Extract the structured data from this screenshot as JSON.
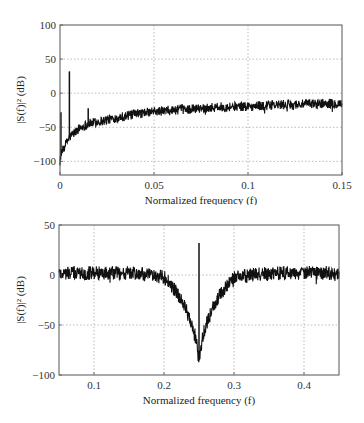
{
  "chart_data": [
    {
      "type": "line",
      "title": "",
      "xlabel": "Normalized frequency (f)",
      "ylabel": "|S(f)|² (dB)",
      "xlim": [
        0,
        0.15
      ],
      "ylim": [
        -120,
        100
      ],
      "xticks": [
        0,
        0.05,
        0.1,
        0.15
      ],
      "xtick_labels": [
        "0",
        "0.05",
        "0.1",
        "0.15"
      ],
      "yticks": [
        -100,
        -50,
        0,
        50,
        100
      ],
      "ytick_labels": [
        "−100",
        "−50",
        "0",
        "50",
        "100"
      ],
      "grid": true,
      "legend": null,
      "series": [
        {
          "name": "spectrum",
          "description": "Noisy power spectrum rising from about -100 dB near f=0 to about -15 dB at f=0.15, with a sharp spike at f≈0.005 and a small peak at f≈0.015",
          "x": [
            0.0,
            0.002,
            0.005,
            0.01,
            0.015,
            0.02,
            0.03,
            0.04,
            0.05,
            0.06,
            0.07,
            0.08,
            0.09,
            0.1,
            0.11,
            0.12,
            0.13,
            0.14,
            0.15
          ],
          "y": [
            -95,
            -80,
            -65,
            -52,
            -45,
            -42,
            -36,
            -31,
            -27,
            -25,
            -23,
            -21,
            -20,
            -19,
            -18,
            -17,
            -16,
            -15,
            -15
          ],
          "peaks": [
            {
              "x": 0.005,
              "y": 32
            },
            {
              "x": 0.015,
              "y": -22
            },
            {
              "x": 0.0005,
              "y": -28
            }
          ]
        }
      ]
    },
    {
      "type": "line",
      "title": "",
      "xlabel": "Normalized frequency (f)",
      "ylabel": "|S(f)|² (dB)",
      "xlim": [
        0.05,
        0.45
      ],
      "ylim": [
        -100,
        50
      ],
      "xticks": [
        0.1,
        0.2,
        0.3,
        0.4
      ],
      "xtick_labels": [
        "0.1",
        "0.2",
        "0.3",
        "0.4"
      ],
      "yticks": [
        -100,
        -50,
        0,
        50
      ],
      "ytick_labels": [
        "−100",
        "−50",
        "0",
        "50"
      ],
      "grid": true,
      "legend": null,
      "series": [
        {
          "name": "spectrum",
          "description": "Noisy flat spectrum around 0 dB with a notch centered at f=0.25 reaching about -85 dB, and a sharp spike at f=0.25 reaching about +32 dB",
          "x": [
            0.05,
            0.1,
            0.15,
            0.2,
            0.21,
            0.22,
            0.23,
            0.24,
            0.245,
            0.25,
            0.255,
            0.26,
            0.27,
            0.28,
            0.29,
            0.3,
            0.35,
            0.4,
            0.45
          ],
          "y": [
            2,
            2,
            2,
            -2,
            -10,
            -20,
            -32,
            -50,
            -62,
            -85,
            -62,
            -50,
            -32,
            -20,
            -10,
            -2,
            2,
            2,
            2
          ],
          "peaks": [
            {
              "x": 0.25,
              "y": 32
            }
          ]
        }
      ]
    }
  ]
}
